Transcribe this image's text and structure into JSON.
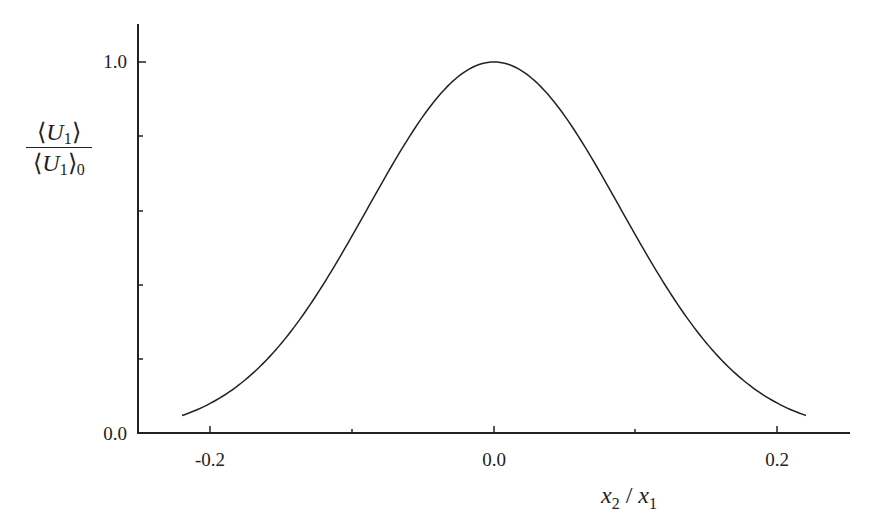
{
  "chart_data": {
    "type": "line",
    "title": "",
    "xlabel": "x2 / x1",
    "ylabel": "⟨U1⟩ / ⟨U1⟩0",
    "xlim": [
      -0.25,
      0.25
    ],
    "ylim": [
      0.0,
      1.1
    ],
    "x_ticks": [
      -0.2,
      -0.1,
      0.0,
      0.1,
      0.2
    ],
    "x_tick_labels": [
      "-0.2",
      "",
      "0.0",
      "",
      "0.2"
    ],
    "y_ticks": [
      0.0,
      0.2,
      0.4,
      0.6,
      0.8,
      1.0
    ],
    "y_tick_labels": [
      "0.0",
      "",
      "",
      "",
      "",
      "1.0"
    ],
    "grid": false,
    "legend": null,
    "series": [
      {
        "name": "Gaussian profile",
        "x": [
          -0.22,
          -0.2,
          -0.18,
          -0.16,
          -0.14,
          -0.12,
          -0.1,
          -0.08,
          -0.06,
          -0.04,
          -0.02,
          0.0,
          0.02,
          0.04,
          0.06,
          0.08,
          0.1,
          0.12,
          0.14,
          0.16,
          0.18,
          0.2,
          0.22
        ],
        "values": [
          0.047,
          0.08,
          0.129,
          0.197,
          0.289,
          0.402,
          0.532,
          0.667,
          0.796,
          0.904,
          0.975,
          1.0,
          0.975,
          0.904,
          0.796,
          0.667,
          0.532,
          0.402,
          0.289,
          0.197,
          0.129,
          0.08,
          0.047
        ],
        "color": "#222222"
      }
    ]
  },
  "axes": {
    "x_label_main": "x",
    "x_label_sub": "2",
    "x_label_sep": " / ",
    "x_label_main2": "x",
    "x_label_sub2": "1",
    "y_label_num_main": "U",
    "y_label_num_sub": "1",
    "y_label_den_main": "U",
    "y_label_den_sub": "1",
    "y_label_den_outer_sub": "0",
    "y_tick_top": "1.0",
    "y_tick_bottom": "0.0",
    "x_tick_left": "-0.2",
    "x_tick_mid": "0.0",
    "x_tick_right": "0.2"
  }
}
